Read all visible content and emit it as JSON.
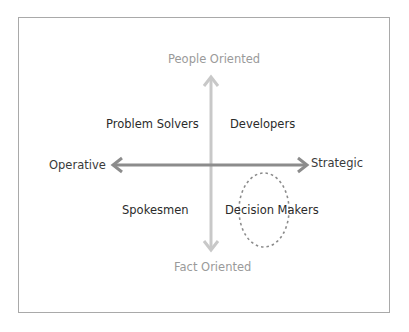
{
  "diagram": {
    "axes": {
      "top": "People Oriented",
      "bottom": "Fact Oriented",
      "left": "Operative",
      "right": "Strategic"
    },
    "quadrants": {
      "top_left": "Problem Solvers",
      "top_right": "Developers",
      "bottom_left": "Spokesmen",
      "bottom_right": "Decision Makers"
    },
    "highlight": {
      "shape": "dashed-ellipse",
      "target": "Decision Makers"
    },
    "colors": {
      "frame": "#a9a9a9",
      "vertical_arrow": "#c8c8c8",
      "horizontal_arrow": "#8c8c8c",
      "ellipse": "#8c8c8c",
      "axis_text": "#9a9a9a",
      "quadrant_text": "#2b2b2b"
    }
  }
}
